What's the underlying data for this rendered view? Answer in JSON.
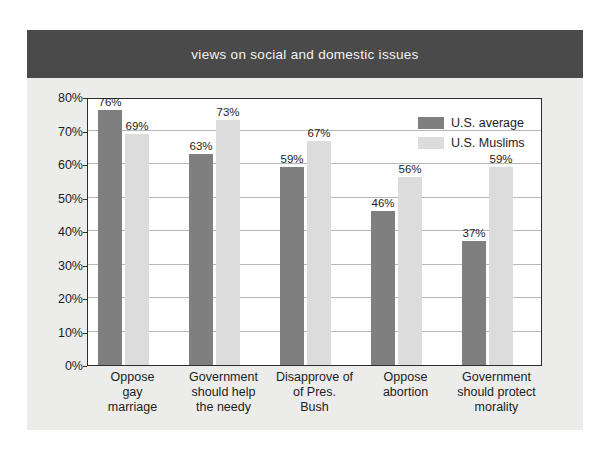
{
  "figure": {
    "title": "views on social and domestic issues",
    "banner_color": "#4a4a4a",
    "background_color": "#ececeb"
  },
  "chart_data": {
    "type": "bar",
    "title": "views on social and domestic issues",
    "xlabel": "",
    "ylabel": "",
    "ylim": [
      0,
      80
    ],
    "ytick_labels": [
      "0%",
      "10%",
      "20%",
      "30%",
      "40%",
      "50%",
      "60%",
      "70%",
      "80%"
    ],
    "ytick_values": [
      0,
      10,
      20,
      30,
      40,
      50,
      60,
      70,
      80
    ],
    "grid": true,
    "legend_position": "upper-right-inside",
    "categories": [
      "Oppose gay marriage",
      "Government should help the needy",
      "Disapprove of of Pres. Bush",
      "Oppose abortion",
      "Government should protect morality"
    ],
    "category_lines": [
      [
        "Oppose",
        "gay",
        "marriage"
      ],
      [
        "Government",
        "should help",
        "the needy"
      ],
      [
        "Disapprove of",
        "of Pres.",
        "Bush"
      ],
      [
        "Oppose",
        "abortion"
      ],
      [
        "Government",
        "should protect",
        "morality"
      ]
    ],
    "series": [
      {
        "name": "U.S. average",
        "color": "#7f7f7f",
        "values": [
          76,
          63,
          59,
          46,
          37
        ],
        "labels": [
          "76%",
          "63%",
          "59%",
          "46%",
          "37%"
        ]
      },
      {
        "name": "U.S. Muslims",
        "color": "#dcdcdc",
        "values": [
          69,
          73,
          67,
          56,
          59
        ],
        "labels": [
          "69%",
          "73%",
          "67%",
          "56%",
          "59%"
        ]
      }
    ]
  }
}
